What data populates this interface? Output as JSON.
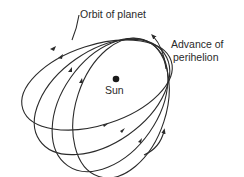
{
  "diagram": {
    "labels": {
      "orbit": "Orbit of planet",
      "advance_line1": "Advance of",
      "advance_line2": "perihelion",
      "sun": "Sun"
    },
    "orbit_count": 4,
    "colors": {
      "stroke": "#2b2b2b",
      "background": "#ffffff"
    }
  }
}
